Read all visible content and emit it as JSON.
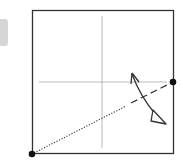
{
  "diagram": {
    "type": "origami-fold-step",
    "paper": {
      "x": 32,
      "y": 10,
      "size": 142,
      "stroke": "#333333"
    },
    "crease_lines": {
      "vertical_x": 102,
      "horizontal_y": 82,
      "color": "#999999"
    },
    "reference_points": [
      {
        "name": "bottom-left-corner",
        "x": 32,
        "y": 154
      },
      {
        "name": "right-edge-midpoint",
        "x": 173,
        "y": 82
      }
    ],
    "fold_line": {
      "from": [
        34,
        152
      ],
      "to": [
        171,
        83
      ],
      "style": "dotted-then-dashed"
    },
    "arrow": {
      "type": "valley-fold",
      "color": "#333333"
    }
  },
  "side_tab": {
    "color": "#d6d6d6"
  }
}
